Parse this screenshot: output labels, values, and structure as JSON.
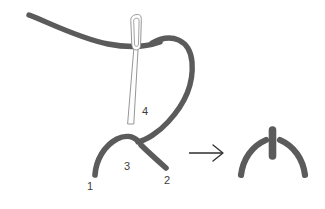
{
  "figure": {
    "background_color": "#ffffff",
    "thread_color": "#5b5b5b",
    "thread_edge_color": "#474747",
    "needle_outline_color": "#8a8a8a",
    "needle_fill_color": "#fdfdfd",
    "arrow_color": "#2e2e2e",
    "label_color": "#3d3d3d"
  },
  "labels": {
    "point_1": "1",
    "point_2": "2",
    "point_3": "3",
    "point_4": "4"
  },
  "elements": {
    "thread_tail": "working-thread-tail",
    "thread_loop": "working-thread-loop",
    "needle": "embroidery-needle",
    "needle_eye": "needle-eye",
    "left_stitch_arm": "left-stitch-arm",
    "right_stitch_arm": "right-stitch-arm",
    "arrow": "progress-arrow",
    "result_left_arm": "result-left-arm",
    "result_right_arm": "result-right-arm",
    "result_anchor": "result-anchor-bar"
  }
}
